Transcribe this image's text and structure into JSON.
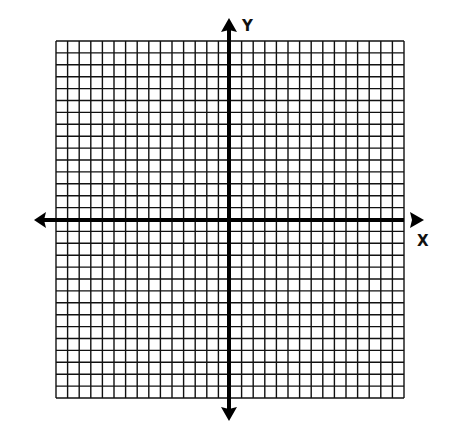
{
  "diagram": {
    "type": "coordinate-plane",
    "grid": {
      "columns": 30,
      "rows": 30,
      "line_color": "#111111",
      "background": "#ffffff"
    },
    "axes": {
      "x_label": "X",
      "y_label": "Y",
      "color": "#000000"
    }
  }
}
